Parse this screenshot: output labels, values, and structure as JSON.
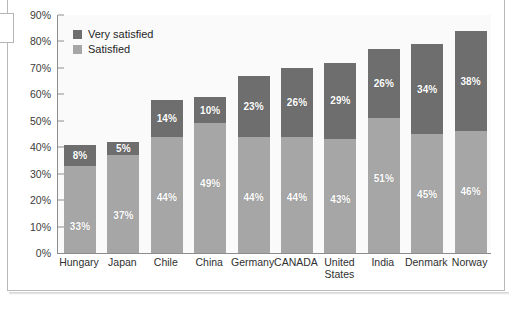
{
  "chart_data": {
    "type": "bar",
    "subtype": "stacked-bar",
    "title": "",
    "xlabel": "",
    "ylabel": "",
    "ylim": [
      0,
      90
    ],
    "ytick_labels": [
      "90%",
      "80%",
      "70%",
      "60%",
      "50%",
      "40%",
      "30%",
      "20%",
      "10%",
      "0%"
    ],
    "ytick_values": [
      90,
      80,
      70,
      60,
      50,
      40,
      30,
      20,
      10,
      0
    ],
    "grid": false,
    "legend_position": "top-left",
    "categories": [
      "Hungary",
      "Japan",
      "Chile",
      "China",
      "Germany",
      "CANADA",
      "United\nStates",
      "India",
      "Denmark",
      "Norway"
    ],
    "series": [
      {
        "name": "Satisfied",
        "color": "#a6a6a6",
        "values": [
          33,
          37,
          44,
          49,
          44,
          44,
          43,
          51,
          45,
          46
        ],
        "labels": [
          "33%",
          "37%",
          "44%",
          "49%",
          "44%",
          "44%",
          "43%",
          "51%",
          "45%",
          "46%"
        ]
      },
      {
        "name": "Very satisfied",
        "color": "#6e6e6e",
        "values": [
          8,
          5,
          14,
          10,
          23,
          26,
          29,
          26,
          34,
          38
        ],
        "labels": [
          "8%",
          "5%",
          "14%",
          "10%",
          "23%",
          "26%",
          "29%",
          "26%",
          "34%",
          "38%"
        ]
      }
    ],
    "totals": [
      41,
      42,
      58,
      59,
      67,
      70,
      72,
      77,
      79,
      84
    ]
  },
  "legend": {
    "items": [
      {
        "label": "Very satisfied",
        "color": "#6e6e6e"
      },
      {
        "label": "Satisfied",
        "color": "#a6a6a6"
      }
    ]
  },
  "colors": {
    "very_satisfied": "#6e6e6e",
    "satisfied": "#a6a6a6",
    "axis": "#8d8d8d",
    "plot_background": "#fafafa",
    "frame": "#b9b9b9"
  }
}
